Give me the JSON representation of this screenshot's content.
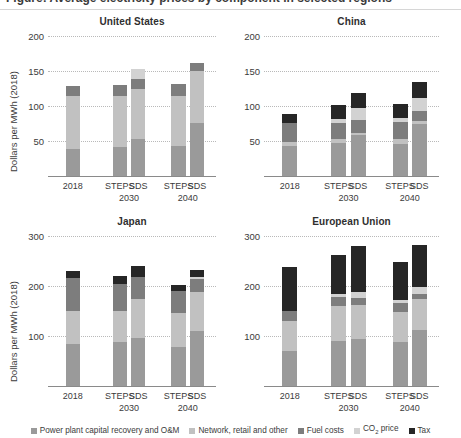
{
  "figure": {
    "cut_off_heading": "Figure: Average electricity prices by component in selected regions",
    "y_axis_label": "Dollars per MWh (2018)"
  },
  "legend": {
    "items": [
      {
        "label": "Power plant capital recovery and O&M",
        "color": "#9a9a9a",
        "key": "power_plant"
      },
      {
        "label": "Network, retail and other",
        "color": "#c1c1c1",
        "key": "network"
      },
      {
        "label": "Fuel costs",
        "color": "#7d7d7d",
        "key": "fuel"
      },
      {
        "label": "CO2 price",
        "color": "#d2d2d2",
        "key": "co2",
        "label_html": "CO<sub>2</sub> price"
      },
      {
        "label": "Tax",
        "color": "#262626",
        "key": "tax"
      }
    ]
  },
  "chart_data": {
    "type": "bar",
    "subtype": "stacked-bar-small-multiples",
    "xlabel": "",
    "ylabel": "Dollars per MWh (2018)",
    "grid": true,
    "legend_position": "bottom",
    "categories": [
      "2018",
      "STEPS",
      "SDS",
      "STEPS",
      "SDS"
    ],
    "category_groups": [
      "",
      "2030",
      "2030",
      "2040",
      "2040"
    ],
    "group_labels": [
      "2030",
      "2040"
    ],
    "series_names": [
      "Power plant capital recovery and O&M",
      "Network, retail and other",
      "Fuel costs",
      "CO2 price",
      "Tax"
    ],
    "panels": [
      {
        "name": "United States",
        "ylim": [
          0,
          200
        ],
        "yticks": [
          50,
          100,
          150,
          200
        ],
        "series": [
          {
            "name": "Power plant capital recovery and O&M",
            "values": [
              38,
              42,
              53,
              43,
              76
            ]
          },
          {
            "name": "Network, retail and other",
            "values": [
              77,
              73,
              72,
              72,
              74
            ]
          },
          {
            "name": "Fuel costs",
            "values": [
              13,
              15,
              13,
              16,
              12
            ]
          },
          {
            "name": "CO2 price",
            "values": [
              0,
              0,
              15,
              0,
              0
            ]
          },
          {
            "name": "Tax",
            "values": [
              0,
              0,
              0,
              0,
              0
            ]
          }
        ],
        "totals": [
          128,
          130,
          153,
          131,
          162
        ]
      },
      {
        "name": "China",
        "ylim": [
          0,
          200
        ],
        "yticks": [
          50,
          100,
          150,
          200
        ],
        "series": [
          {
            "name": "Power plant capital recovery and O&M",
            "values": [
              43,
              47,
              58,
              46,
              75
            ]
          },
          {
            "name": "Network, retail and other",
            "values": [
              5,
              6,
              4,
              7,
              3
            ]
          },
          {
            "name": "Fuel costs",
            "values": [
              28,
              23,
              18,
              24,
              15
            ]
          },
          {
            "name": "CO2 price",
            "values": [
              0,
              6,
              17,
              6,
              18
            ]
          },
          {
            "name": "Tax",
            "values": [
              12,
              20,
              22,
              20,
              23
            ]
          }
        ],
        "totals": [
          88,
          102,
          119,
          103,
          134
        ]
      },
      {
        "name": "Japan",
        "ylim": [
          0,
          300
        ],
        "yticks": [
          100,
          200,
          300
        ],
        "series": [
          {
            "name": "Power plant capital recovery and O&M",
            "values": [
              85,
              88,
              96,
              78,
              110
            ]
          },
          {
            "name": "Network, retail and other",
            "values": [
              65,
              62,
              78,
              68,
              78
            ]
          },
          {
            "name": "Fuel costs",
            "values": [
              66,
              54,
              44,
              44,
              27
            ]
          },
          {
            "name": "CO2 price",
            "values": [
              0,
              0,
              0,
              0,
              4
            ]
          },
          {
            "name": "Tax",
            "values": [
              14,
              16,
              22,
              12,
              14
            ]
          }
        ],
        "totals": [
          230,
          220,
          240,
          202,
          233
        ]
      },
      {
        "name": "European Union",
        "ylim": [
          0,
          300
        ],
        "yticks": [
          100,
          200,
          300
        ],
        "series": [
          {
            "name": "Power plant capital recovery and O&M",
            "values": [
              70,
              90,
              95,
              88,
              112
            ]
          },
          {
            "name": "Network, retail and other",
            "values": [
              60,
              70,
              68,
              60,
              62
            ]
          },
          {
            "name": "Fuel costs",
            "values": [
              20,
              18,
              14,
              18,
              10
            ]
          },
          {
            "name": "CO2 price",
            "values": [
              0,
              6,
              12,
              6,
              14
            ]
          },
          {
            "name": "Tax",
            "values": [
              88,
              78,
              92,
              76,
              84
            ]
          }
        ],
        "totals": [
          238,
          262,
          281,
          248,
          282
        ]
      }
    ]
  }
}
